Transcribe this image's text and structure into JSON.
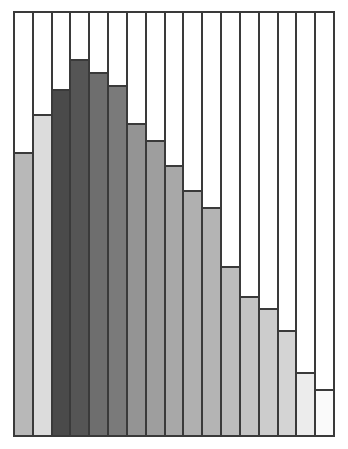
{
  "chart_data": {
    "type": "bar",
    "title": "",
    "subtitle": "",
    "xlabel": "",
    "ylabel": "",
    "grid": false,
    "legend": false,
    "legend_position": "none",
    "axis_ticks_visible": false,
    "tick_labels_visible": false,
    "ylim": [
      0,
      100
    ],
    "categories": [
      "1",
      "2",
      "3",
      "4",
      "5",
      "6",
      "7",
      "8",
      "9",
      "10",
      "11",
      "12",
      "13",
      "14",
      "15",
      "16",
      "17"
    ],
    "values": [
      67,
      76,
      82,
      89,
      86,
      83,
      74,
      70,
      64,
      58,
      54,
      40,
      33,
      30,
      25,
      15,
      11
    ],
    "bar_colors": [
      "#b8b8b8",
      "#dcdcdc",
      "#4a4a4a",
      "#555555",
      "#6e6e6e",
      "#7a7a7a",
      "#949494",
      "#9e9e9e",
      "#a8a8a8",
      "#b0b0b0",
      "#b4b4b4",
      "#bcbcbc",
      "#c4c4c4",
      "#cccccc",
      "#d4d4d4",
      "#ececec",
      "#fafafa"
    ],
    "outline_color": "#3a3a3a",
    "background_color": "#ffffff",
    "bar_count": 17,
    "annotations": []
  }
}
